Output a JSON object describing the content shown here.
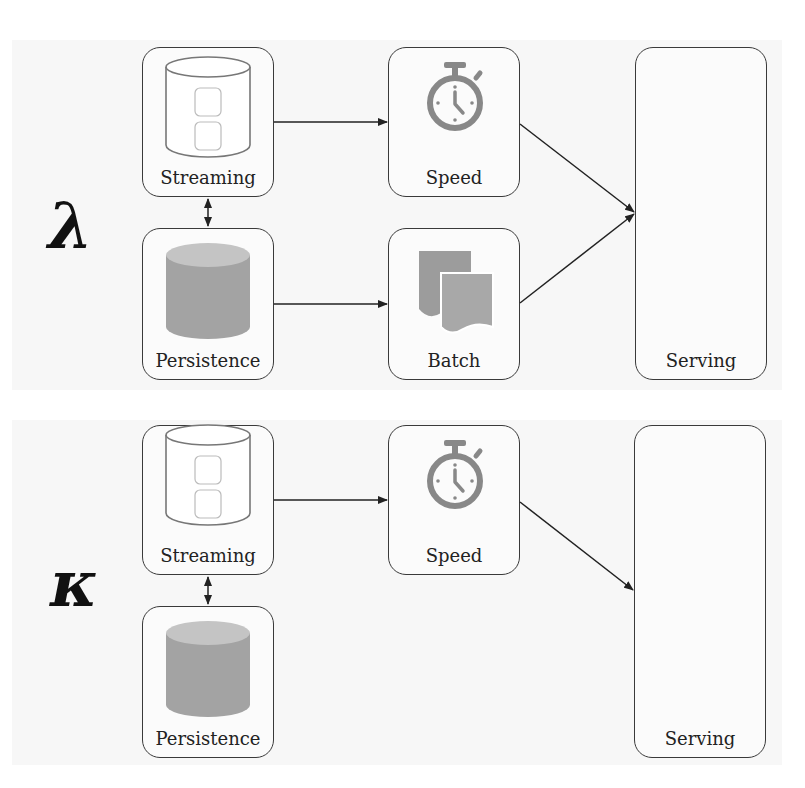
{
  "diagrams": {
    "lambda": {
      "symbol": "λ",
      "nodes": {
        "streaming": "Streaming",
        "persistence": "Persistence",
        "speed": "Speed",
        "batch": "Batch",
        "serving": "Serving"
      }
    },
    "kappa": {
      "symbol": "κ",
      "nodes": {
        "streaming": "Streaming",
        "persistence": "Persistence",
        "speed": "Speed",
        "serving": "Serving"
      }
    }
  },
  "colors": {
    "stroke": "#3a3a3a",
    "icon_gray": "#8a8a8a",
    "fill_gray": "#a6a6a6",
    "panel_bg": "#f7f7f7"
  }
}
